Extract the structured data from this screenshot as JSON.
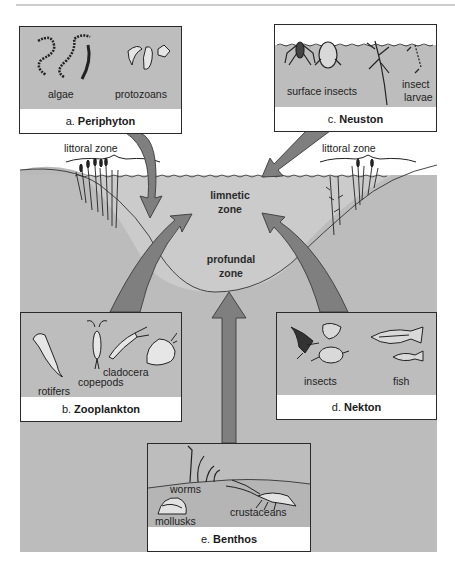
{
  "figure": {
    "zones": {
      "littoral_left": "littoral zone",
      "littoral_right": "littoral zone",
      "limnetic_line1": "limnetic",
      "limnetic_line2": "zone",
      "profundal_line1": "profundal",
      "profundal_line2": "zone"
    },
    "panels": {
      "periphyton": {
        "letter": "a.",
        "title": "Periphyton",
        "items": [
          "algae",
          "protozoans"
        ]
      },
      "zooplankton": {
        "letter": "b.",
        "title": "Zooplankton",
        "items": [
          "rotifers",
          "copepods",
          "cladocera"
        ]
      },
      "neuston": {
        "letter": "c.",
        "title": "Neuston",
        "items": [
          "surface insects",
          "insect",
          "larvae"
        ]
      },
      "nekton": {
        "letter": "d.",
        "title": "Nekton",
        "items": [
          "insects",
          "fish"
        ]
      },
      "benthos": {
        "letter": "e.",
        "title": "Benthos",
        "items": [
          "worms",
          "mollusks",
          "crustaceans"
        ]
      }
    },
    "colors": {
      "ground": "#b9b9b9",
      "water": "#c9c9c9",
      "arrow": "#7f7f7f",
      "panel_bg": "#bdbdbd",
      "strip": "#ffffff"
    }
  }
}
